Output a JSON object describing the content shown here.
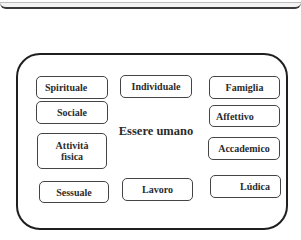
{
  "diagram": {
    "center": "Essere umano",
    "nodes": {
      "spirituale": "Spirituale",
      "sociale": "Sociale",
      "attivita_fisica_line1": "Attività",
      "attivita_fisica_line2": "fìsica",
      "sessuale": "Sessuale",
      "individuale": "Individuale",
      "lavoro": "Lavoro",
      "famiglia": "Famiglia",
      "affettivo": "Affettivo",
      "accademico": "Accademico",
      "ludica": "Lúdica"
    }
  }
}
